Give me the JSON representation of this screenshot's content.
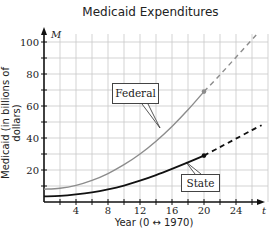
{
  "chart_data": {
    "type": "line",
    "title": "Medicaid Expenditures",
    "xlabel": "Year (0 ↔ 1970)",
    "ylabel": "Medicaid (in billions of dollars)",
    "x_axis_symbol": "t",
    "y_axis_symbol": "M",
    "xlim": [
      0,
      28
    ],
    "ylim": [
      0,
      105
    ],
    "x_ticks": [
      4,
      8,
      12,
      16,
      20,
      24
    ],
    "y_ticks": [
      20,
      40,
      60,
      80,
      100
    ],
    "grid": true,
    "legend": "callout labels",
    "series": [
      {
        "name": "Federal",
        "color": "#8c8c8c",
        "x": [
          0,
          2,
          4,
          6,
          8,
          10,
          12,
          14,
          16,
          18,
          20
        ],
        "values": [
          8,
          8.6,
          10.4,
          13.5,
          17.8,
          23.3,
          30.0,
          38.0,
          47.2,
          57.6,
          69.0
        ],
        "projection": {
          "x": [
            20,
            22,
            24,
            26,
            26.8
          ],
          "values": [
            69.0,
            79.5,
            90.5,
            101.5,
            106.0
          ],
          "style": "dashed"
        },
        "marked_point": {
          "x": 20,
          "y": 69
        }
      },
      {
        "name": "State",
        "color": "#111111",
        "x": [
          0,
          2,
          4,
          6,
          8,
          10,
          12,
          14,
          16,
          18,
          20
        ],
        "values": [
          3.5,
          3.8,
          4.7,
          6.0,
          7.9,
          10.3,
          13.3,
          16.8,
          20.7,
          24.8,
          29.0
        ],
        "projection": {
          "x": [
            20,
            22,
            24,
            26,
            27.2
          ],
          "values": [
            29.0,
            34.3,
            39.6,
            44.9,
            48.0
          ],
          "style": "dashed"
        },
        "marked_point": {
          "x": 20,
          "y": 29
        }
      }
    ]
  },
  "labels": {
    "title": "Medicaid Expenditures",
    "xlabel": "Year (0 ↔ 1970)",
    "ylabel": "Medicaid (in billions of dollars)",
    "x_symbol": "t",
    "y_symbol": "M",
    "federal": "Federal",
    "state": "State",
    "x_ticks": [
      "4",
      "8",
      "12",
      "16",
      "20",
      "24"
    ],
    "y_ticks": [
      "20",
      "40",
      "60",
      "80",
      "100"
    ]
  }
}
